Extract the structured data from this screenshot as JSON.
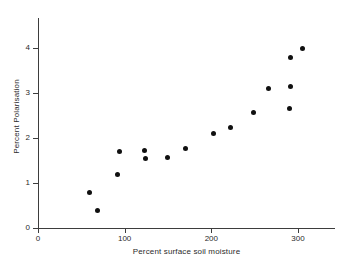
{
  "chart_data": {
    "type": "scatter",
    "title": "",
    "xlabel": "Percent surface soil moisture",
    "ylabel": "Percent Polarisation",
    "xlim": [
      0,
      320
    ],
    "ylim": [
      0,
      4.7
    ],
    "grid": false,
    "legend": null,
    "xticks": [
      0,
      100,
      200,
      300
    ],
    "xtick_labels": [
      "0",
      "100",
      "200",
      "300"
    ],
    "yticks": [
      0,
      1,
      2,
      3,
      4
    ],
    "ytick_labels": [
      "0",
      "1",
      "2",
      "3",
      "4"
    ],
    "marker": "filled-circle",
    "marker_color": "#101010",
    "points": [
      {
        "x": 59,
        "y": 0.78
      },
      {
        "x": 69,
        "y": 0.4
      },
      {
        "x": 92,
        "y": 1.2
      },
      {
        "x": 94,
        "y": 1.69
      },
      {
        "x": 123,
        "y": 1.73
      },
      {
        "x": 124,
        "y": 1.55
      },
      {
        "x": 149,
        "y": 1.57
      },
      {
        "x": 170,
        "y": 1.77
      },
      {
        "x": 203,
        "y": 2.09
      },
      {
        "x": 222,
        "y": 2.24
      },
      {
        "x": 249,
        "y": 2.57
      },
      {
        "x": 266,
        "y": 3.09
      },
      {
        "x": 290,
        "y": 2.65
      },
      {
        "x": 291,
        "y": 3.14
      },
      {
        "x": 291,
        "y": 3.8
      },
      {
        "x": 305,
        "y": 3.98
      }
    ]
  },
  "axes": {
    "x_title": "Percent surface soil moisture",
    "y_title": "Percent Polarisation"
  }
}
